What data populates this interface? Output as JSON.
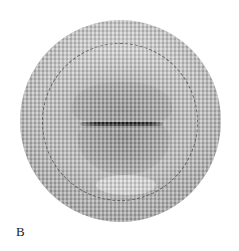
{
  "figure": {
    "panel_label": "B",
    "image": {
      "description": "grayscale halftone photograph of lips within a circular field",
      "shape": "circle",
      "overlay": "dashed-circle-outline",
      "colors": {
        "background": "#ffffff",
        "disc_mid": "#b5b5b5",
        "mouth_line": "#1f1f1f",
        "dashed_ring": "#4a4a4a"
      }
    }
  }
}
